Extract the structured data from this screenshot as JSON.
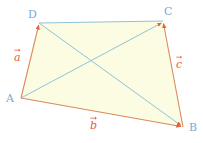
{
  "figure": {
    "kind": "vector-quadrilateral-diagram",
    "canvas": {
      "width": 203,
      "height": 143,
      "background": "#ffffff"
    },
    "fill_color": "#fcfce2",
    "edge_color": "#d98a5e",
    "diagonal_color": "#8fc3d8",
    "top_edge_color": "#8fc3d8",
    "vertex_label_color": "#7ba7d7",
    "vector_label_color": "#e2603a",
    "vertices": [
      {
        "name": "A",
        "x": 21,
        "y": 98,
        "label": "A",
        "label_x": 6,
        "label_y": 93
      },
      {
        "name": "B",
        "x": 183,
        "y": 127,
        "label": "B",
        "label_x": 189,
        "label_y": 122
      },
      {
        "name": "C",
        "x": 163,
        "y": 21,
        "label": "C",
        "label_x": 164,
        "label_y": 6
      },
      {
        "name": "D",
        "x": 39,
        "y": 23,
        "label": "D",
        "label_x": 28,
        "label_y": 9
      }
    ],
    "edges": [
      {
        "name": "AD",
        "from": "A",
        "to": "D",
        "color": "#d98a5e",
        "arrow": true
      },
      {
        "name": "AB",
        "from": "A",
        "to": "B",
        "color": "#d98a5e",
        "arrow": true
      },
      {
        "name": "BC",
        "from": "B",
        "to": "C",
        "color": "#d98a5e",
        "arrow": true
      },
      {
        "name": "DC",
        "from": "D",
        "to": "C",
        "color": "#8fc3d8",
        "arrow": false
      }
    ],
    "diagonals": [
      {
        "name": "AC",
        "from": "A",
        "to": "C",
        "color": "#8fc3d8",
        "arrow": true
      },
      {
        "name": "DB",
        "from": "D",
        "to": "B",
        "color": "#8fc3d8",
        "arrow": true
      }
    ],
    "vector_labels": [
      {
        "name": "a",
        "text": "a",
        "x": 14,
        "y": 52,
        "edge": "AD"
      },
      {
        "name": "b",
        "text": "b",
        "x": 90,
        "y": 120,
        "edge": "AB"
      },
      {
        "name": "c",
        "text": "c",
        "x": 176,
        "y": 59,
        "edge": "BC"
      }
    ]
  }
}
